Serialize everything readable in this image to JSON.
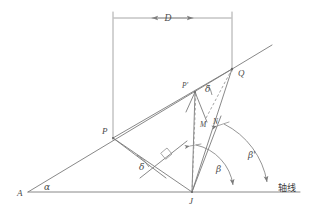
{
  "figure": {
    "background_color": "#ffffff",
    "line_color": "#7a7a7a",
    "label_color": "#4a4a4a"
  },
  "labels": {
    "dimension_D": "D",
    "point_A": "A",
    "point_P": "P",
    "point_P_prime": "P'",
    "point_Q": "Q",
    "point_M": "M",
    "point_N": "N",
    "point_J": "J",
    "angle_alpha": "α",
    "angle_delta_lower": "δ",
    "angle_delta_upper": "δ",
    "angle_beta": "β",
    "angle_beta_prime": "β'",
    "axis_line": "轴线"
  },
  "geometry": {
    "axis_y": 192,
    "axis_x_start": 28,
    "axis_x_end": 300,
    "dimension_y": 18,
    "dimension_x_left": 113,
    "dimension_x_right": 232,
    "points": {
      "A": [
        28,
        192
      ],
      "P": [
        113,
        138
      ],
      "P_prime": [
        195,
        92
      ],
      "Q": [
        232,
        69
      ],
      "M": [
        207,
        120
      ],
      "N": [
        218,
        118
      ],
      "J": [
        192,
        192
      ]
    }
  }
}
